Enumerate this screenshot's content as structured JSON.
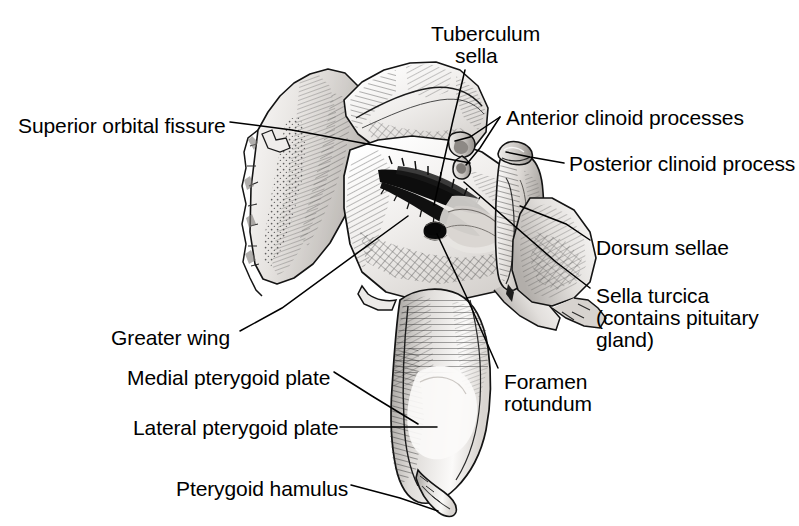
{
  "figure": {
    "view": "superior / posterior-oblique view",
    "background_color": "#ffffff",
    "ink_color": "#000000",
    "bone_light": "#f2f0ee",
    "bone_mid": "#c9c6c2",
    "bone_dark": "#8e8b87"
  },
  "labels": [
    {
      "id": "superior-orbital-fissure",
      "text": "Superior orbital fissure",
      "x": 18,
      "y": 114,
      "align": "left",
      "leader": [
        [
          230,
          122
        ],
        [
          292,
          130
        ],
        [
          470,
          163
        ]
      ]
    },
    {
      "id": "tuberculum-sella",
      "text": "Tuberculum",
      "x": 431,
      "y": 22,
      "align": "left",
      "leader": [
        [
          465,
          70
        ],
        [
          453,
          120
        ],
        [
          434,
          205
        ]
      ]
    },
    {
      "id": "tuberculum-sella-line2",
      "text": "sella",
      "x": 455,
      "y": 44,
      "align": "left",
      "leader": []
    },
    {
      "id": "anterior-clinoid-processes",
      "text": "Anterior clinoid processes",
      "x": 506,
      "y": 106,
      "align": "left",
      "leader": [
        [
          500,
          117
        ],
        [
          455,
          140
        ]
      ],
      "leader2": [
        [
          500,
          117
        ],
        [
          470,
          163
        ]
      ]
    },
    {
      "id": "posterior-clinoid-process",
      "text": "Posterior clinoid process",
      "x": 569,
      "y": 152,
      "align": "left",
      "leader": [
        [
          564,
          163
        ],
        [
          504,
          153
        ]
      ]
    },
    {
      "id": "dorsum-sellae",
      "text": "Dorsum sellae",
      "x": 596,
      "y": 236,
      "align": "left",
      "leader": [
        [
          590,
          240
        ],
        [
          565,
          222
        ],
        [
          520,
          205
        ]
      ]
    },
    {
      "id": "sella-turcica",
      "text": "Sella turcica",
      "x": 596,
      "y": 284,
      "align": "left",
      "leader": [
        [
          590,
          288
        ],
        [
          556,
          262
        ],
        [
          463,
          181
        ]
      ]
    },
    {
      "id": "sella-turcica-line2",
      "text": "(contains pituitary",
      "x": 596,
      "y": 306,
      "align": "left",
      "leader": []
    },
    {
      "id": "sella-turcica-line3",
      "text": "gland)",
      "x": 596,
      "y": 328,
      "align": "left",
      "leader": []
    },
    {
      "id": "foramen-rotundum",
      "text": "Foramen",
      "x": 504,
      "y": 370,
      "align": "left",
      "leader": [
        [
          498,
          368
        ],
        [
          470,
          300
        ],
        [
          435,
          231
        ]
      ]
    },
    {
      "id": "foramen-rotundum-line2",
      "text": "rotundum",
      "x": 504,
      "y": 392,
      "align": "left",
      "leader": []
    },
    {
      "id": "greater-wing",
      "text": "Greater wing",
      "x": 111,
      "y": 326,
      "align": "left",
      "leader": [
        [
          240,
          331
        ],
        [
          280,
          310
        ],
        [
          408,
          216
        ]
      ]
    },
    {
      "id": "medial-pterygoid-plate",
      "text": "Medial pterygoid plate",
      "x": 127,
      "y": 366,
      "align": "left",
      "leader": [
        [
          334,
          372
        ],
        [
          372,
          396
        ],
        [
          418,
          423
        ]
      ]
    },
    {
      "id": "lateral-pterygoid-plate",
      "text": "Lateral pterygoid plate",
      "x": 133,
      "y": 416,
      "align": "left",
      "leader": [
        [
          340,
          427
        ],
        [
          436,
          427
        ]
      ]
    },
    {
      "id": "pterygoid-hamulus",
      "text": "Pterygoid hamulus",
      "x": 176,
      "y": 477,
      "align": "left",
      "leader": [
        [
          351,
          485
        ],
        [
          400,
          498
        ],
        [
          437,
          510
        ]
      ]
    }
  ]
}
